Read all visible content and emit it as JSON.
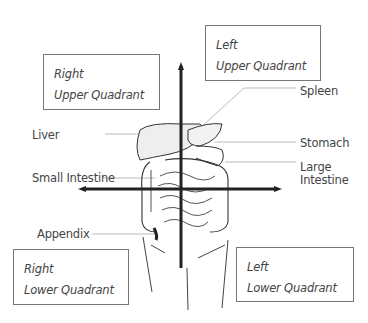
{
  "diagram": {
    "quadrants": {
      "ruq": {
        "line1": "Right",
        "line2": "Upper Quadrant"
      },
      "luq": {
        "line1": "Left",
        "line2": "Upper Quadrant"
      },
      "rlq": {
        "line1": "Right",
        "line2": "Lower Quadrant"
      },
      "llq": {
        "line1": "Left",
        "line2": "Lower Quadrant"
      }
    },
    "organs": {
      "liver": "Liver",
      "spleen": "Spleen",
      "stomach": "Stomach",
      "small_intestine": "Small Intestine",
      "large_intestine_1": "Large",
      "large_intestine_2": "Intestine",
      "appendix": "Appendix"
    },
    "colors": {
      "axis": "#222222",
      "outline": "#333333",
      "leader": "#aaaaaa",
      "box_border": "#777777"
    }
  }
}
